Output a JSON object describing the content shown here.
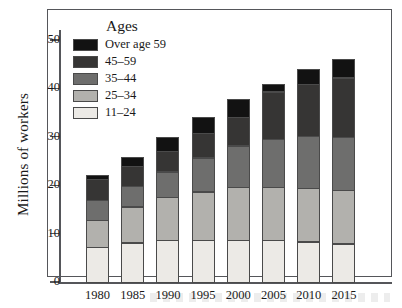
{
  "chart_data": {
    "type": "bar",
    "stacked": true,
    "title": "",
    "xlabel": "",
    "ylabel": "Millions of workers",
    "ylim": [
      0,
      50
    ],
    "yticks": [
      0,
      10,
      20,
      30,
      40,
      50
    ],
    "grid": false,
    "legend_title": "Ages",
    "legend_position": "top-left-inside",
    "categories": [
      "1980",
      "1985",
      "1990",
      "1995",
      "2000",
      "2005",
      "2010",
      "2015"
    ],
    "series": [
      {
        "name": "11–24",
        "color": "#eceae6",
        "values": [
          7.5,
          8.4,
          9.0,
          9.0,
          9.0,
          9.0,
          8.6,
          8.2
        ]
      },
      {
        "name": "25–34",
        "color": "#b2b1ad",
        "values": [
          5.8,
          7.6,
          8.9,
          10.1,
          11.0,
          11.0,
          11.2,
          11.3
        ]
      },
      {
        "name": "35–44",
        "color": "#6e6e6d",
        "values": [
          4.2,
          4.4,
          5.5,
          7.2,
          8.8,
          10.2,
          10.9,
          11.0
        ]
      },
      {
        "name": "45–59",
        "color": "#363534",
        "values": [
          4.5,
          4.4,
          4.5,
          5.2,
          6.1,
          9.9,
          11.0,
          12.5
        ]
      },
      {
        "name": "Over age 59",
        "color": "#121212",
        "values": [
          1.0,
          2.0,
          3.0,
          3.5,
          3.9,
          1.7,
          3.3,
          4.0
        ]
      }
    ],
    "totals": [
      23.0,
      26.8,
      30.9,
      35.0,
      38.8,
      41.8,
      45.0,
      47.0
    ]
  },
  "axes": {
    "y_title": "Millions of workers",
    "y_ticks": [
      "50",
      "40",
      "30",
      "20",
      "10",
      "0"
    ],
    "x_ticks": [
      "1980",
      "1985",
      "1990",
      "1995",
      "2000",
      "2005",
      "2010",
      "2015"
    ]
  },
  "legend": {
    "title": "Ages",
    "entries": [
      {
        "label": "Over age 59",
        "color": "#121212"
      },
      {
        "label": "45–59",
        "color": "#363534"
      },
      {
        "label": "35–44",
        "color": "#6e6e6d"
      },
      {
        "label": "25–34",
        "color": "#b2b1ad"
      },
      {
        "label": "11–24",
        "color": "#eceae6"
      }
    ]
  },
  "style": {
    "frame_color": "#55565a",
    "background": "#ffffff",
    "text_color": "#1a1a1a"
  }
}
